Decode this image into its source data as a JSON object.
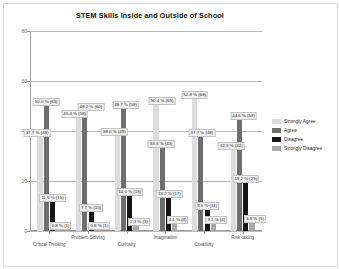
{
  "chart_data": {
    "type": "bar",
    "title": "STEM Skills Inside and Outside of School",
    "xlabel": "",
    "ylabel": "",
    "ylim": [
      0,
      80
    ],
    "yticks": [
      0,
      20,
      40,
      60,
      80
    ],
    "grid": true,
    "legend_position": "right",
    "categories": [
      "Critical Thinking",
      "Problem Solving",
      "Curiosity",
      "Imagination",
      "Creativity",
      "Risk-taking"
    ],
    "series": [
      {
        "name": "Strongly Agree",
        "color": "#dcdcdc",
        "values": [
          37.7,
          45.4,
          38.0,
          50.4,
          52.8,
          32.3
        ],
        "counts": [
          48,
          58,
          49,
          65,
          68,
          42
        ],
        "labels": [
          "37.7 % (48)",
          "45.4 % (58)",
          "38.0 % (49)",
          "50.4 % (65)",
          "52.8 % (68)",
          "32.3 % (42)"
        ]
      },
      {
        "name": "Agree",
        "color": "#6e6e6e",
        "values": [
          50.0,
          48.2,
          48.7,
          33.3,
          37.7,
          44.6
        ],
        "counts": [
          65,
          60,
          58,
          43,
          48,
          58
        ],
        "labels": [
          "50.0 % (65)",
          "48.2 % (60)",
          "48.7 % (58)",
          "33.3 % (43)",
          "37.7 % (48)",
          "44.6 % (58)"
        ]
      },
      {
        "name": "Disagree",
        "color": "#141414",
        "values": [
          11.5,
          7.7,
          14.0,
          13.2,
          8.5,
          19.2
        ],
        "counts": [
          15,
          10,
          18,
          17,
          11,
          25
        ],
        "labels": [
          "11.5 % (15)",
          "7.7 % (10)",
          "14.0 % (18)",
          "13.2 % (17)",
          "8.5 % (11)",
          "19.2 % (25)"
        ]
      },
      {
        "name": "Strongly Disagree",
        "color": "#a8a8a8",
        "values": [
          0.8,
          0.8,
          2.3,
          3.1,
          3.1,
          3.8
        ],
        "counts": [
          1,
          1,
          3,
          4,
          4,
          5
        ],
        "labels": [
          "0.8 % (1)",
          "0.8 % (1)",
          "2.3 % (3)",
          "3.1 % (4)",
          "3.1 % (4)",
          "3.8 % (5)"
        ]
      }
    ]
  },
  "legend": {
    "items": [
      {
        "label": "Strongly Agree",
        "color": "#dcdcdc"
      },
      {
        "label": "Agree",
        "color": "#6e6e6e"
      },
      {
        "label": "Disagree",
        "color": "#141414"
      },
      {
        "label": "Strongly Disagree",
        "color": "#a8a8a8"
      }
    ]
  }
}
